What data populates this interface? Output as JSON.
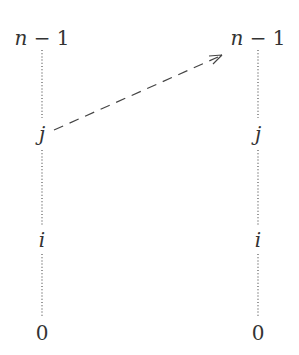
{
  "diagram": {
    "columns": [
      {
        "id": "left",
        "labels": [
          {
            "text": "n − 1",
            "italic_var": "n",
            "rest": " − 1"
          },
          {
            "text": "j"
          },
          {
            "text": "i"
          },
          {
            "text": "0"
          }
        ]
      },
      {
        "id": "right",
        "labels": [
          {
            "text": "n − 1",
            "italic_var": "n",
            "rest": " − 1"
          },
          {
            "text": "j"
          },
          {
            "text": "i"
          },
          {
            "text": "0"
          }
        ]
      }
    ],
    "edges": [
      {
        "from": "left.j",
        "to": "right.n−1",
        "style": "dashed",
        "arrow": true
      }
    ],
    "colors": {
      "ink": "#333333",
      "dots": "#555555"
    }
  }
}
